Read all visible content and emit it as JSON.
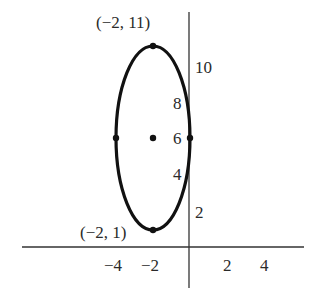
{
  "figure": {
    "type": "ellipse-graph",
    "ellipse": {
      "center": [
        -2,
        6
      ],
      "semi_major_vertical": 5,
      "semi_minor_horizontal": 2,
      "equation_form": "(x+2)^2/4 + (y-6)^2/25 = 1",
      "marked_points": [
        {
          "name": "top-vertex",
          "x": -2,
          "y": 11
        },
        {
          "name": "bottom-vertex",
          "x": -2,
          "y": 1
        },
        {
          "name": "left-vertex",
          "x": -4,
          "y": 6
        },
        {
          "name": "right-vertex",
          "x": 0,
          "y": 6
        },
        {
          "name": "center",
          "x": -2,
          "y": 6
        }
      ]
    },
    "annotations": {
      "top_vertex": "(−2, 11)",
      "bottom_vertex": "(−2, 1)"
    },
    "x_axis": {
      "ticks": [
        {
          "value": -4,
          "label": "−4"
        },
        {
          "value": -2,
          "label": "−2"
        },
        {
          "value": 2,
          "label": "2"
        },
        {
          "value": 4,
          "label": "4"
        }
      ]
    },
    "y_axis": {
      "ticks": [
        {
          "value": 2,
          "label": "2"
        },
        {
          "value": 4,
          "label": "4"
        },
        {
          "value": 6,
          "label": "6"
        },
        {
          "value": 8,
          "label": "8"
        },
        {
          "value": 10,
          "label": "10"
        }
      ]
    },
    "colors": {
      "curve": "#111111",
      "axes": "#333333",
      "text": "#2a2a2a",
      "background": "#ffffff"
    }
  }
}
